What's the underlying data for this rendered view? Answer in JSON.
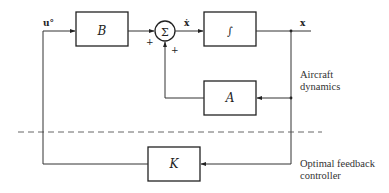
{
  "diagram": {
    "blocks": {
      "B": {
        "label": "B"
      },
      "integrator": {
        "label": "∫"
      },
      "A": {
        "label": "A"
      },
      "K": {
        "label": "K"
      }
    },
    "summer": {
      "label": "Σ",
      "sign_left": "+",
      "sign_bottom": "+"
    },
    "signals": {
      "input": "u°",
      "derivative": "ẋ",
      "state": "x"
    },
    "regions": {
      "plant": [
        "Aircraft",
        "dynamics"
      ],
      "controller": [
        "Optimal feedback",
        "controller"
      ]
    },
    "colors": {
      "line": "#333333",
      "background": "#ffffff"
    }
  }
}
